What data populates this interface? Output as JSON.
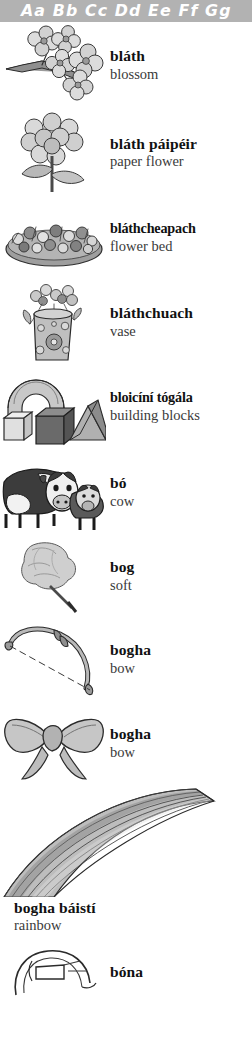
{
  "header": {
    "alphabet": "Aa Bb Cc Dd Ee Ff Gg",
    "background_color": "#b2b2b2",
    "text_color": "#ffffff"
  },
  "entries": [
    {
      "term": "bláth",
      "gloss": "blossom",
      "illustration": "blossom-branch-illustration"
    },
    {
      "term": "bláth páipéir",
      "gloss": "paper flower",
      "illustration": "paper-flower-illustration"
    },
    {
      "term": "bláthcheapach",
      "gloss": "flower bed",
      "illustration": "flower-bed-illustration"
    },
    {
      "term": "bláthchuach",
      "gloss": "vase",
      "illustration": "vase-illustration"
    },
    {
      "term": "bloicíní tógála",
      "gloss": "building blocks",
      "illustration": "building-blocks-illustration"
    },
    {
      "term": "bó",
      "gloss": "cow",
      "illustration": "cow-illustration"
    },
    {
      "term": "bog",
      "gloss": "soft",
      "illustration": "cotton-wool-illustration"
    },
    {
      "term": "bogha",
      "gloss": "bow",
      "illustration": "archery-bow-illustration"
    },
    {
      "term": "bogha",
      "gloss": "bow",
      "illustration": "ribbon-bow-illustration"
    },
    {
      "term": "bogha báistí",
      "gloss": "rainbow",
      "illustration": "rainbow-illustration"
    },
    {
      "term": "bóna",
      "gloss": "",
      "illustration": "collar-illustration"
    }
  ],
  "colors": {
    "ink": "#111111",
    "gloss": "#3a3a3a",
    "art_light": "#d8d8d8",
    "art_mid": "#a8a8a8",
    "art_dark": "#6e6e6e",
    "page_background": "#ffffff"
  }
}
